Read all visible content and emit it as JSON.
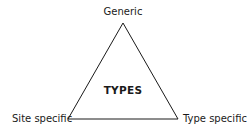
{
  "diagram": {
    "center_label": "TYPES",
    "vertices": {
      "top": "Generic",
      "bottom_left": "Site specific",
      "bottom_right": "Type specific"
    },
    "colors": {
      "line": "#1a1a1a",
      "text": "#1a1a1a",
      "background": "#ffffff"
    }
  }
}
